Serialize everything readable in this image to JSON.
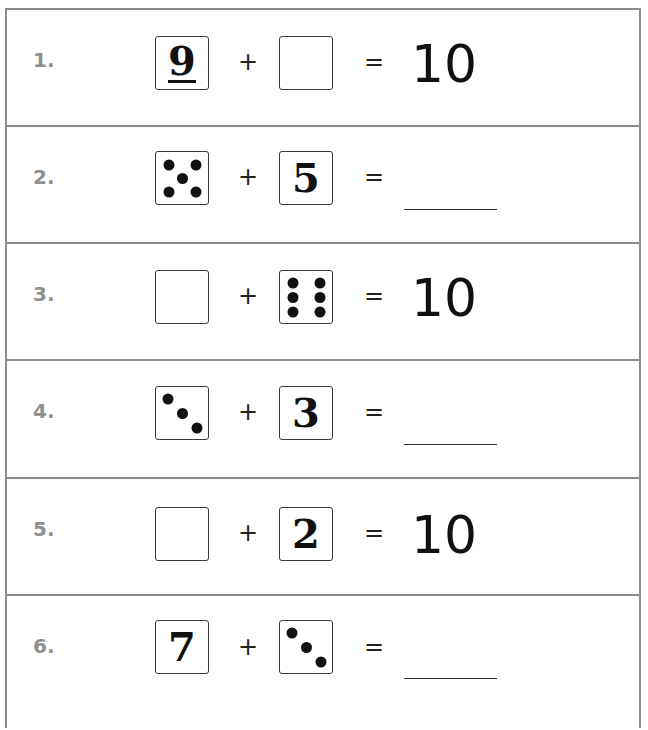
{
  "worksheet": {
    "colors": {
      "border": "#8c8c8c",
      "row_number": "#8f8f8f",
      "ink": "#111111"
    },
    "rows": [
      {
        "number": "1.",
        "left": {
          "type": "digit",
          "value": "9",
          "underlined": true
        },
        "operator": "+",
        "right": {
          "type": "empty-box"
        },
        "equals": "=",
        "result": {
          "type": "value",
          "value": "10"
        }
      },
      {
        "number": "2.",
        "left": {
          "type": "dice",
          "pips": 5
        },
        "operator": "+",
        "right": {
          "type": "digit",
          "value": "5"
        },
        "equals": "=",
        "result": {
          "type": "blank-line"
        }
      },
      {
        "number": "3.",
        "left": {
          "type": "empty-box"
        },
        "operator": "+",
        "right": {
          "type": "dice",
          "pips": 6
        },
        "equals": "=",
        "result": {
          "type": "value",
          "value": "10"
        }
      },
      {
        "number": "4.",
        "left": {
          "type": "dice",
          "pips": 3
        },
        "operator": "+",
        "right": {
          "type": "digit",
          "value": "3"
        },
        "equals": "=",
        "result": {
          "type": "blank-line"
        }
      },
      {
        "number": "5.",
        "left": {
          "type": "empty-box"
        },
        "operator": "+",
        "right": {
          "type": "digit",
          "value": "2"
        },
        "equals": "=",
        "result": {
          "type": "value",
          "value": "10"
        }
      },
      {
        "number": "6.",
        "left": {
          "type": "digit",
          "value": "7"
        },
        "operator": "+",
        "right": {
          "type": "dice",
          "pips": 3
        },
        "equals": "=",
        "result": {
          "type": "blank-line"
        }
      }
    ]
  }
}
